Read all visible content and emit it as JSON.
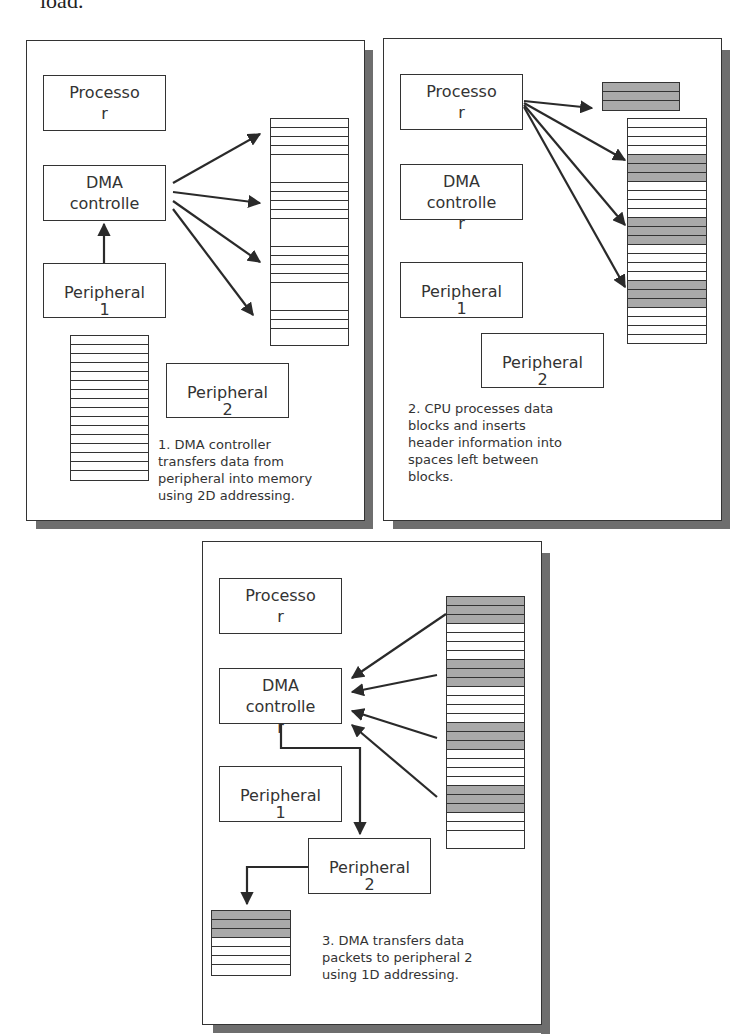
{
  "header_fragment": "load.",
  "colors": {
    "line": "#333333",
    "shaded_block": "#a9a9a9",
    "shadow": "#6e6e6e"
  },
  "panels": [
    {
      "id": 1,
      "boxes": {
        "processor": [
          "Processo",
          "r"
        ],
        "dma": [
          "DMA",
          "controlle"
        ],
        "peripheral1": [
          "Peripheral",
          "1"
        ],
        "peripheral2": [
          "Peripheral",
          "2"
        ]
      },
      "caption": [
        "1. DMA controller",
        "transfers data from",
        "peripheral into memory",
        "using 2D addressing."
      ]
    },
    {
      "id": 2,
      "boxes": {
        "processor": [
          "Processo",
          "r"
        ],
        "dma": [
          "DMA",
          "controlle",
          "r"
        ],
        "peripheral1": [
          "Peripheral",
          "1"
        ],
        "peripheral2": [
          "Peripheral",
          "2"
        ]
      },
      "caption": [
        "2. CPU processes data",
        "blocks and inserts",
        "header information into",
        "spaces left between",
        "blocks."
      ]
    },
    {
      "id": 3,
      "boxes": {
        "processor": [
          "Processo",
          "r"
        ],
        "dma": [
          "DMA",
          "controlle",
          "r"
        ],
        "peripheral1": [
          "Peripheral",
          "1"
        ],
        "peripheral2": [
          "Peripheral",
          "2"
        ]
      },
      "caption": [
        "3. DMA transfers data",
        "packets to peripheral 2",
        "using 1D addressing."
      ]
    }
  ]
}
